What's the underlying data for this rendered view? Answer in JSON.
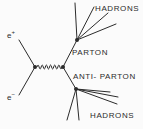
{
  "figure": {
    "type": "feynman-diagram",
    "title": "",
    "background_color": "#fbfbfb",
    "stroke_color": "#2b2b2b",
    "width": 143,
    "height": 129
  },
  "labels": {
    "hadrons_top": "HADRONS",
    "hadrons_bottom": "HADRONS",
    "parton": "PARTON",
    "anti_parton": "ANTI- PARTON",
    "positron": "e",
    "positron_charge": "+",
    "electron": "e",
    "electron_charge": "−"
  },
  "diagram_data": {
    "vertices": [
      {
        "name": "annihilation-vertex",
        "x": 35,
        "y": 67
      },
      {
        "name": "photon-decay-vertex",
        "x": 63,
        "y": 67
      },
      {
        "name": "parton-hadronization-vertex",
        "x": 77,
        "y": 40
      },
      {
        "name": "antiparton-hadronization-vertex",
        "x": 76,
        "y": 89
      }
    ],
    "propagator": {
      "name": "virtual-photon",
      "style": "wavy",
      "x_start": 37,
      "x_end": 62,
      "y": 67,
      "humps": 6,
      "amplitude": 4
    },
    "incoming": [
      {
        "name": "positron-line",
        "x1": 19,
        "y1": 40,
        "x2": 35,
        "y2": 67
      },
      {
        "name": "electron-line",
        "x1": 19,
        "y1": 95,
        "x2": 35,
        "y2": 67
      }
    ],
    "internal": [
      {
        "name": "parton-line",
        "x1": 63,
        "y1": 67,
        "x2": 77,
        "y2": 40
      },
      {
        "name": "antiparton-line",
        "x1": 63,
        "y1": 67,
        "x2": 76,
        "y2": 89
      }
    ],
    "jet_top": [
      {
        "x1": 77,
        "y1": 40,
        "x2": 75,
        "y2": 3
      },
      {
        "x1": 77,
        "y1": 40,
        "x2": 94,
        "y2": 7
      },
      {
        "x1": 77,
        "y1": 40,
        "x2": 108,
        "y2": 13
      },
      {
        "x1": 77,
        "y1": 40,
        "x2": 116,
        "y2": 24
      }
    ],
    "jet_bottom": [
      {
        "x1": 76,
        "y1": 89,
        "x2": 67,
        "y2": 120
      },
      {
        "x1": 76,
        "y1": 89,
        "x2": 79,
        "y2": 120
      },
      {
        "x1": 76,
        "y1": 89,
        "x2": 117,
        "y2": 104
      },
      {
        "x1": 76,
        "y1": 89,
        "x2": 118,
        "y2": 97
      },
      {
        "x1": 76,
        "y1": 89,
        "x2": 110,
        "y2": 92
      }
    ]
  }
}
